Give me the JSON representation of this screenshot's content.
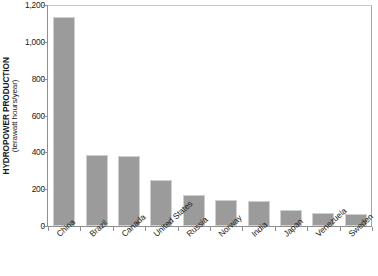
{
  "chart_data": {
    "type": "bar",
    "title": "",
    "xlabel": "",
    "ylabel": "HYDROPOWER PRODUCTION",
    "ylabel_units": "(terawatt hours/year)",
    "ylim": [
      0,
      1200
    ],
    "ytick_values": [
      0,
      200,
      400,
      600,
      800,
      1000,
      1200
    ],
    "ytick_labels": [
      "0",
      "200",
      "400",
      "600",
      "800",
      "1,000",
      "1,200"
    ],
    "grid": false,
    "legend": false,
    "bar_color": "#9b9b9b",
    "categories": [
      "China",
      "Brazil",
      "Canada",
      "United States",
      "Russia",
      "Norway",
      "India",
      "Japan",
      "Venezuela",
      "Sweden"
    ],
    "values": [
      1135,
      385,
      378,
      250,
      170,
      142,
      135,
      88,
      72,
      66
    ]
  }
}
